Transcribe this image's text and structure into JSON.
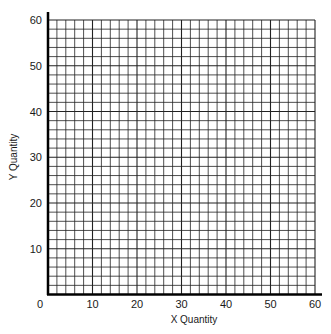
{
  "chart_data": {
    "type": "scatter",
    "title": "",
    "xlabel": "X Quantity",
    "ylabel": "Y Quantity",
    "xlim": [
      0,
      60
    ],
    "ylim": [
      0,
      60
    ],
    "x_ticks": [
      "0",
      "10",
      "20",
      "30",
      "40",
      "50",
      "60"
    ],
    "y_ticks": [
      "10",
      "20",
      "30",
      "40",
      "50",
      "60"
    ],
    "grid": true,
    "grid_step": 2,
    "series": []
  },
  "colors": {
    "grid": "#222222",
    "axis": "#000000",
    "background": "#ffffff"
  }
}
